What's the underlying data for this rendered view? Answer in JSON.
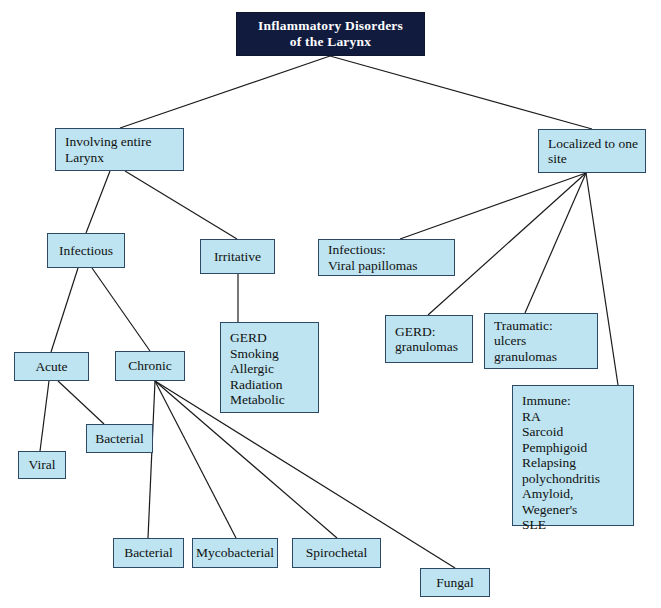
{
  "diagram": {
    "type": "flowchart",
    "title_node": {
      "id": "root",
      "label": "Inflammatory Disorders\nof the Larynx",
      "x": 236,
      "y": 12,
      "w": 189,
      "h": 44,
      "fill": "#111b3e",
      "text_color": "#ffffff"
    },
    "node_fill": "#bde4f0",
    "node_border": "#2c4a66",
    "nodes": [
      {
        "id": "involving-entire-larynx",
        "label": "Involving entire\nLarynx",
        "align": "left",
        "x": 55,
        "y": 128,
        "w": 129,
        "h": 43
      },
      {
        "id": "localized-to-one-site",
        "label": "Localized to one\nsite",
        "align": "left",
        "x": 538,
        "y": 129,
        "w": 108,
        "h": 44
      },
      {
        "id": "infectious",
        "label": "Infectious",
        "align": "center",
        "x": 47,
        "y": 233,
        "w": 78,
        "h": 35
      },
      {
        "id": "irritative",
        "label": "Irritative",
        "align": "center",
        "x": 200,
        "y": 239,
        "w": 75,
        "h": 35
      },
      {
        "id": "infectious-viral-papillomas",
        "label": "Infectious:\nViral papillomas",
        "align": "left",
        "x": 318,
        "y": 239,
        "w": 137,
        "h": 37
      },
      {
        "id": "gerd-granulomas",
        "label": "GERD:\ngranulomas",
        "align": "left",
        "x": 385,
        "y": 315,
        "w": 88,
        "h": 48
      },
      {
        "id": "traumatic-ulcers-granulomas",
        "label": "Traumatic:\nulcers\ngranulomas",
        "align": "left",
        "x": 484,
        "y": 313,
        "w": 114,
        "h": 56
      },
      {
        "id": "irritative-causes",
        "label": "GERD\nSmoking\nAllergic\nRadiation\nMetabolic",
        "align": "left",
        "listbox": true,
        "x": 220,
        "y": 322,
        "w": 99,
        "h": 91
      },
      {
        "id": "immune-causes",
        "label": "Immune:\nRA\nSarcoid\nPemphigoid\nRelapsing\npolychondritis\nAmyloid,\nWegener's\nSLE",
        "align": "left",
        "listbox": true,
        "x": 512,
        "y": 385,
        "w": 122,
        "h": 141
      },
      {
        "id": "acute",
        "label": "Acute",
        "align": "center",
        "x": 14,
        "y": 352,
        "w": 75,
        "h": 29
      },
      {
        "id": "chronic",
        "label": "Chronic",
        "align": "center",
        "x": 115,
        "y": 351,
        "w": 70,
        "h": 30
      },
      {
        "id": "acute-bacterial",
        "label": "Bacterial",
        "align": "center",
        "x": 86,
        "y": 424,
        "w": 67,
        "h": 29
      },
      {
        "id": "acute-viral",
        "label": "Viral",
        "align": "center",
        "x": 18,
        "y": 451,
        "w": 48,
        "h": 28
      },
      {
        "id": "chronic-bacterial",
        "label": "Bacterial",
        "align": "center",
        "x": 113,
        "y": 538,
        "w": 71,
        "h": 30
      },
      {
        "id": "chronic-mycobacterial",
        "label": "Mycobacterial",
        "align": "center",
        "x": 192,
        "y": 538,
        "w": 86,
        "h": 30
      },
      {
        "id": "chronic-spirochetal",
        "label": "Spirochetal",
        "align": "center",
        "x": 292,
        "y": 538,
        "w": 89,
        "h": 30
      },
      {
        "id": "chronic-fungal",
        "label": "Fungal",
        "align": "center",
        "x": 420,
        "y": 568,
        "w": 70,
        "h": 29
      }
    ],
    "edges": [
      {
        "from": "root",
        "to": "involving-entire-larynx",
        "x1": 330,
        "y1": 56,
        "x2": 120,
        "y2": 128
      },
      {
        "from": "root",
        "to": "localized-to-one-site",
        "x1": 330,
        "y1": 56,
        "x2": 592,
        "y2": 129
      },
      {
        "from": "involving-entire-larynx",
        "to": "infectious",
        "x1": 110,
        "y1": 171,
        "x2": 86,
        "y2": 233
      },
      {
        "from": "involving-entire-larynx",
        "to": "irritative",
        "x1": 125,
        "y1": 171,
        "x2": 237,
        "y2": 239
      },
      {
        "from": "infectious",
        "to": "acute",
        "x1": 78,
        "y1": 268,
        "x2": 51,
        "y2": 352
      },
      {
        "from": "infectious",
        "to": "chronic",
        "x1": 92,
        "y1": 268,
        "x2": 150,
        "y2": 351
      },
      {
        "from": "irritative",
        "to": "irritative-causes",
        "x1": 238,
        "y1": 274,
        "x2": 238,
        "y2": 322
      },
      {
        "from": "acute",
        "to": "acute-viral",
        "x1": 49,
        "y1": 381,
        "x2": 40,
        "y2": 451
      },
      {
        "from": "acute",
        "to": "acute-bacterial",
        "x1": 58,
        "y1": 381,
        "x2": 104,
        "y2": 424
      },
      {
        "from": "chronic",
        "to": "chronic-bacterial",
        "x1": 155,
        "y1": 381,
        "x2": 148,
        "y2": 538
      },
      {
        "from": "chronic",
        "to": "chronic-mycobacterial",
        "x1": 155,
        "y1": 381,
        "x2": 236,
        "y2": 538
      },
      {
        "from": "chronic",
        "to": "chronic-spirochetal",
        "x1": 155,
        "y1": 381,
        "x2": 337,
        "y2": 538
      },
      {
        "from": "chronic",
        "to": "chronic-fungal",
        "x1": 155,
        "y1": 381,
        "x2": 455,
        "y2": 568
      },
      {
        "from": "localized-to-one-site",
        "to": "infectious-viral-papillomas",
        "x1": 586,
        "y1": 173,
        "x2": 400,
        "y2": 239
      },
      {
        "from": "localized-to-one-site",
        "to": "gerd-granulomas",
        "x1": 586,
        "y1": 173,
        "x2": 428,
        "y2": 315
      },
      {
        "from": "localized-to-one-site",
        "to": "traumatic-ulcers-granulomas",
        "x1": 586,
        "y1": 173,
        "x2": 525,
        "y2": 313
      },
      {
        "from": "localized-to-one-site",
        "to": "immune-causes",
        "x1": 586,
        "y1": 173,
        "x2": 618,
        "y2": 385
      }
    ],
    "edge_color": "#1b1b1b"
  }
}
